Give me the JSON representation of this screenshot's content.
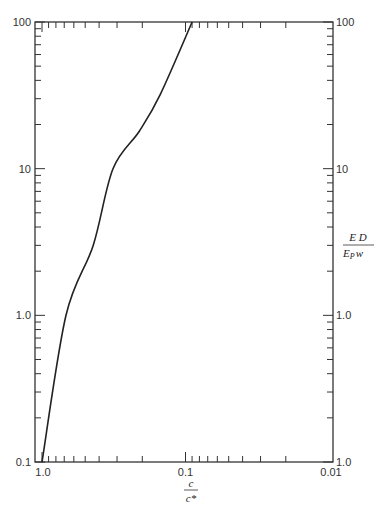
{
  "chart_data": {
    "type": "line",
    "title": "",
    "xlabel": "c / c*",
    "xlabel_num": "c",
    "xlabel_den": "c*",
    "ylabel": "E D / (E_P w)",
    "ylabel_num": "E D",
    "ylabel_den_main": "E",
    "ylabel_den_sub": "P",
    "ylabel_den_tail": "w",
    "x_scale": "log",
    "x_reversed": true,
    "xlim": [
      1.0,
      0.01
    ],
    "y_scale": "log",
    "ylim": [
      0.1,
      100
    ],
    "x_tick_labels": [
      "1.0",
      "0.1",
      "0.01"
    ],
    "y_tick_labels_left": [
      "100",
      "10",
      "1.0",
      "0.1"
    ],
    "y_tick_labels_right": [
      "100",
      "10",
      "1.0",
      "1.0"
    ],
    "grid": false,
    "legend": null,
    "series": [
      {
        "name": "curve",
        "x": [
          1.0,
          0.68,
          0.44,
          0.32,
          0.21,
          0.15,
          0.09
        ],
        "y": [
          0.1,
          1.0,
          3.0,
          10,
          18,
          32,
          100
        ]
      }
    ]
  }
}
